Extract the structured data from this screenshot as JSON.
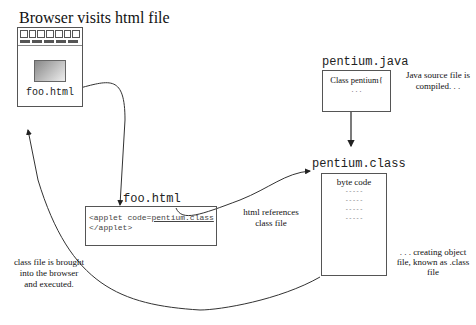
{
  "browser": {
    "title": "Browser visits html file",
    "filename": "foo.html",
    "toolbar_buttons": 7,
    "menu_segments": 5
  },
  "html_file": {
    "title": "foo.html",
    "line1_prefix": "<applet code=",
    "line1_ref": "pentium.class",
    "line2": "</applet>",
    "annotation": [
      "html references",
      "class file"
    ]
  },
  "java_source": {
    "title": "pentium.java",
    "line1": "Class pentium{",
    "line2": ". . .",
    "annotation": [
      "Java source file is",
      "compiled. . ."
    ]
  },
  "class_file": {
    "title": "pentium.class",
    "header": "byte code",
    "lines": [
      "-----",
      "-----",
      "-----",
      "-----"
    ],
    "annotation": [
      ". . . creating object",
      "file, known as .class",
      "file"
    ]
  },
  "return_note": [
    "class file is brought",
    "into the browser",
    "and executed."
  ],
  "colors": {
    "line": "#222222",
    "border": "#444444",
    "gradient_start": "#888888",
    "gradient_end": "#eeeeee"
  }
}
